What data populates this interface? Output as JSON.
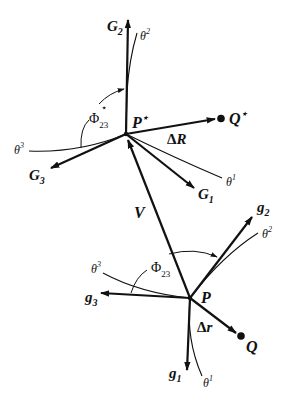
{
  "figure": {
    "upper_frame": {
      "point": "P",
      "point_sup": "⋆",
      "base_vectors": {
        "G1": {
          "base": "G",
          "sub": "1"
        },
        "G2": {
          "base": "G",
          "sub": "2"
        },
        "G3": {
          "base": "G",
          "sub": "3"
        }
      },
      "coordinates": {
        "theta1": {
          "base": "θ",
          "sup": "1"
        },
        "theta2": {
          "base": "θ",
          "sup": "2"
        },
        "theta3": {
          "base": "θ",
          "sup": "3"
        }
      },
      "angle": {
        "base": "Φ",
        "sub": "23",
        "sup": "⋆"
      },
      "target_point": {
        "base": "Q",
        "sup": "⋆"
      },
      "displacement": {
        "delta": "Δ",
        "base": "R"
      }
    },
    "lower_frame": {
      "point": "P",
      "base_vectors": {
        "g1": {
          "base": "g",
          "sub": "1"
        },
        "g2": {
          "base": "g",
          "sub": "2"
        },
        "g3": {
          "base": "g",
          "sub": "3"
        }
      },
      "coordinates": {
        "theta1": {
          "base": "θ",
          "sup": "1"
        },
        "theta2": {
          "base": "θ",
          "sup": "2"
        },
        "theta3": {
          "base": "θ",
          "sup": "3"
        }
      },
      "angle": {
        "base": "Φ",
        "sub": "23"
      },
      "target_point": {
        "base": "Q"
      },
      "displacement": {
        "delta": "Δ",
        "base": "r"
      }
    },
    "connecting_vector": {
      "label": "V"
    },
    "colors": {
      "ink": "#111111",
      "background": "#ffffff"
    }
  }
}
